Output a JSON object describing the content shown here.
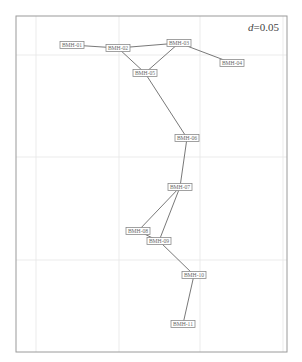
{
  "figure": {
    "annotation_prefix": "d",
    "annotation_value": "=0.05",
    "colors": {
      "frame": "#9a9a9a",
      "grid": "#e6e6e6",
      "edge": "#555555",
      "node_border": "#8a8a8a",
      "node_text": "#6a6a6a"
    }
  },
  "frame": {
    "x": 16,
    "y": 16,
    "width": 271,
    "height": 336
  },
  "grid": {
    "vertical_x": [
      36,
      119,
      200,
      283
    ],
    "horizontal_y": [
      55,
      157,
      260
    ]
  },
  "nodes": [
    {
      "id": "BMH-01",
      "label": "BMH-01",
      "x": 72,
      "y": 45
    },
    {
      "id": "BMH-02",
      "label": "BMH-02",
      "x": 118,
      "y": 48
    },
    {
      "id": "BMH-03",
      "label": "BMH-03",
      "x": 179,
      "y": 43
    },
    {
      "id": "BMH-04",
      "label": "BMH-04",
      "x": 232,
      "y": 63
    },
    {
      "id": "BMH-05",
      "label": "BMH-05",
      "x": 145,
      "y": 73
    },
    {
      "id": "BMH-06",
      "label": "BMH-06",
      "x": 187,
      "y": 138
    },
    {
      "id": "BMH-07",
      "label": "BMH-07",
      "x": 180,
      "y": 187
    },
    {
      "id": "BMH-08",
      "label": "BMH-08",
      "x": 138,
      "y": 231
    },
    {
      "id": "BMH-09",
      "label": "BMH-09",
      "x": 159,
      "y": 241
    },
    {
      "id": "BMH-10",
      "label": "BMH-10",
      "x": 194,
      "y": 275
    },
    {
      "id": "BMH-11",
      "label": "BMH-11",
      "x": 183,
      "y": 324
    }
  ],
  "edges": [
    [
      "BMH-01",
      "BMH-02"
    ],
    [
      "BMH-02",
      "BMH-03"
    ],
    [
      "BMH-02",
      "BMH-05"
    ],
    [
      "BMH-03",
      "BMH-05"
    ],
    [
      "BMH-03",
      "BMH-04"
    ],
    [
      "BMH-05",
      "BMH-06"
    ],
    [
      "BMH-06",
      "BMH-07"
    ],
    [
      "BMH-07",
      "BMH-08"
    ],
    [
      "BMH-07",
      "BMH-09"
    ],
    [
      "BMH-08",
      "BMH-09"
    ],
    [
      "BMH-09",
      "BMH-10"
    ],
    [
      "BMH-10",
      "BMH-11"
    ]
  ]
}
